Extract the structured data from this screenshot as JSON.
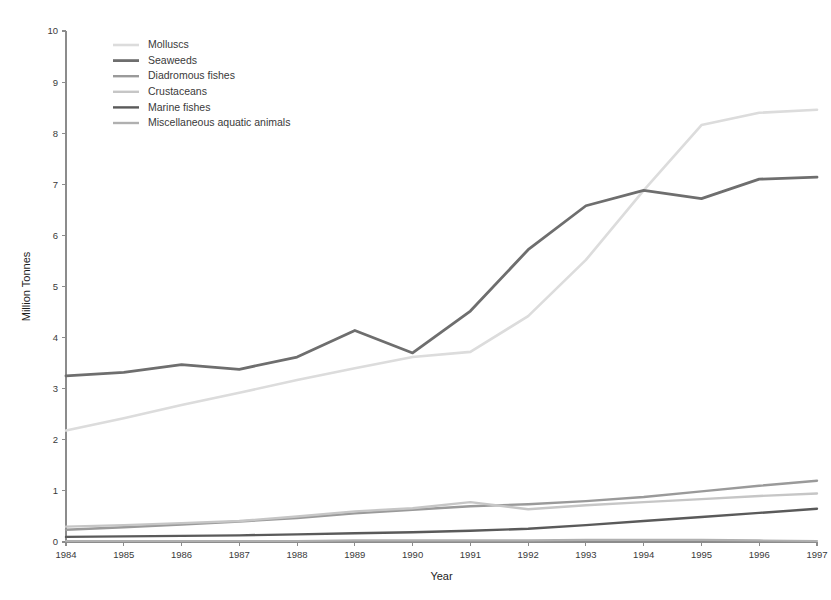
{
  "chart_data": {
    "type": "line",
    "title": "",
    "xlabel": "Year",
    "ylabel": "Million Tonnes",
    "x": [
      1984,
      1985,
      1986,
      1987,
      1988,
      1989,
      1990,
      1991,
      1992,
      1993,
      1994,
      1995,
      1996,
      1997
    ],
    "xlim": [
      1984,
      1997
    ],
    "ylim": [
      0,
      10
    ],
    "yticks": [
      0,
      1,
      2,
      3,
      4,
      5,
      6,
      7,
      8,
      9,
      10
    ],
    "xticks": [
      "1984",
      "1985",
      "1986",
      "1987",
      "1988",
      "1989",
      "1990",
      "1991",
      "1992",
      "1993",
      "1994",
      "1995",
      "1996",
      "1997"
    ],
    "grid": false,
    "legend_position": "top-left",
    "series": [
      {
        "name": "Molluscs",
        "color": "#dcdcdc",
        "width": 2.6,
        "values": [
          2.18,
          2.42,
          2.68,
          2.92,
          3.17,
          3.4,
          3.62,
          3.72,
          4.42,
          5.52,
          6.88,
          8.16,
          8.4,
          8.46
        ]
      },
      {
        "name": "Seaweeds",
        "color": "#6e6e6e",
        "width": 2.8,
        "values": [
          3.25,
          3.32,
          3.47,
          3.38,
          3.62,
          4.14,
          3.7,
          4.52,
          5.72,
          6.58,
          6.88,
          6.72,
          7.1,
          7.14
        ]
      },
      {
        "name": "Diadromous fishes",
        "color": "#9a9a9a",
        "width": 2.4,
        "values": [
          0.24,
          0.29,
          0.34,
          0.4,
          0.47,
          0.56,
          0.63,
          0.7,
          0.74,
          0.8,
          0.88,
          0.99,
          1.1,
          1.2
        ]
      },
      {
        "name": "Crustaceans",
        "color": "#c6c6c6",
        "width": 2.4,
        "values": [
          0.3,
          0.33,
          0.37,
          0.41,
          0.5,
          0.6,
          0.66,
          0.78,
          0.64,
          0.72,
          0.78,
          0.84,
          0.9,
          0.95
        ]
      },
      {
        "name": "Marine fishes",
        "color": "#5a5a5a",
        "width": 2.4,
        "values": [
          0.1,
          0.11,
          0.12,
          0.13,
          0.15,
          0.17,
          0.19,
          0.22,
          0.26,
          0.33,
          0.41,
          0.49,
          0.57,
          0.65
        ]
      },
      {
        "name": "Miscellaneous aquatic animals",
        "color": "#b0b0b0",
        "width": 2.2,
        "values": [
          0.02,
          0.02,
          0.02,
          0.02,
          0.02,
          0.03,
          0.03,
          0.03,
          0.03,
          0.04,
          0.04,
          0.04,
          0.03,
          0.02
        ]
      }
    ]
  },
  "legend": {
    "items": [
      {
        "label": "Molluscs"
      },
      {
        "label": "Seaweeds"
      },
      {
        "label": "Diadromous fishes"
      },
      {
        "label": "Crustaceans"
      },
      {
        "label": "Marine fishes"
      },
      {
        "label": "Miscellaneous aquatic animals"
      }
    ]
  },
  "axes": {
    "y_title": "Million Tonnes",
    "x_title": "Year"
  }
}
